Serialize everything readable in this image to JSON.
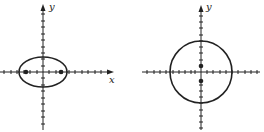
{
  "figures": [
    {
      "id": "left",
      "shape": "ellipse",
      "axis_labels": {
        "x": "x",
        "y": "y"
      },
      "center": [
        0,
        0
      ],
      "semi_major_units": 3.5,
      "semi_minor_units": 2,
      "foci_units": [
        [
          -2.5,
          0
        ],
        [
          2.5,
          0
        ]
      ],
      "has_x_arrow": true,
      "has_y_arrow": true
    },
    {
      "id": "right",
      "shape": "circle",
      "axis_labels": {
        "y": "y"
      },
      "center": [
        0,
        0
      ],
      "radius_units": 5,
      "points_units": [
        [
          0,
          1
        ],
        [
          0,
          -1.5
        ]
      ],
      "has_x_arrow": false,
      "has_y_arrow": true
    }
  ],
  "colors": {
    "stroke": "#222222",
    "background": "#ffffff"
  }
}
